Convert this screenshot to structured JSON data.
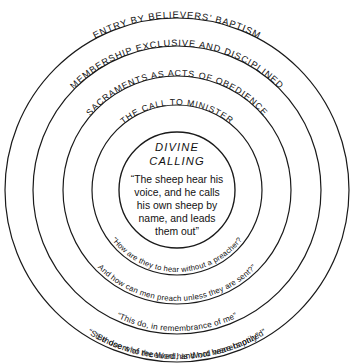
{
  "diagram": {
    "center": {
      "x": 177,
      "y": 190
    },
    "stroke_color": "#1a1a1a",
    "background_color": "#ffffff",
    "core": {
      "title_line1": "DIVINE",
      "title_line2": "CALLING",
      "quote_lines": [
        "“The sheep hear his",
        "voice, and he calls",
        "his own sheep by",
        "name, and leads",
        "them out”"
      ]
    },
    "rings": [
      {
        "index": 1,
        "radius": 58,
        "top_label": "",
        "bottom_label": ""
      },
      {
        "index": 2,
        "radius": 85,
        "top_label": "THE CALL TO MINISTER",
        "top_label_size": 8.6,
        "bottom_label": "“How are they to hear without a preacher?",
        "bottom_label_size": 7.6
      },
      {
        "index": 3,
        "radius": 114,
        "top_label": "SACRAMENTS AS ACTS OF OBEDIENCE",
        "top_label_size": 8.8,
        "bottom_label": "And how can men preach unless they are sent?”",
        "bottom_label_size": 7.8
      },
      {
        "index": 4,
        "radius": 144,
        "top_label": "MEMBERSHIP EXCLUSIVE AND DISCIPLINED",
        "top_label_size": 9.2,
        "bottom_label": "“This do, in remembrance of me”",
        "bottom_label_size": 8.2
      },
      {
        "index": 5,
        "radius": 172,
        "top_label": "ENTRY BY BELIEVERS’ BAPTISM",
        "top_label_size": 9.4,
        "bottom_label": "“Be doers of the Word, and not hearers only”",
        "bottom_label_size": 8.4
      },
      {
        "index": 6,
        "radius": 172,
        "top_label": "",
        "bottom_label": "“So those who received his Word were baptized”",
        "bottom_label_size": 8.4
      }
    ]
  }
}
